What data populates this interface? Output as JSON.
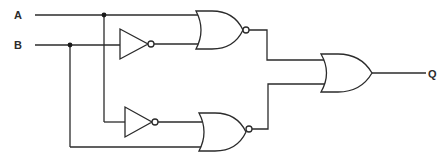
{
  "diagram": {
    "type": "logic-circuit",
    "inputs": [
      {
        "id": "A",
        "label": "A"
      },
      {
        "id": "B",
        "label": "B"
      }
    ],
    "outputs": [
      {
        "id": "Q",
        "label": "Q"
      }
    ],
    "gates": [
      {
        "id": "not1",
        "type": "NOT",
        "inputs": [
          "B"
        ]
      },
      {
        "id": "nor1",
        "type": "NOR",
        "inputs": [
          "A",
          "not1"
        ]
      },
      {
        "id": "not2",
        "type": "NOT",
        "inputs": [
          "A"
        ]
      },
      {
        "id": "nor2",
        "type": "NOR",
        "inputs": [
          "not2",
          "B"
        ]
      },
      {
        "id": "or1",
        "type": "OR",
        "inputs": [
          "nor1",
          "nor2"
        ],
        "output": "Q"
      }
    ],
    "colors": {
      "line": "#2b2b2b",
      "background": "#ffffff"
    }
  }
}
